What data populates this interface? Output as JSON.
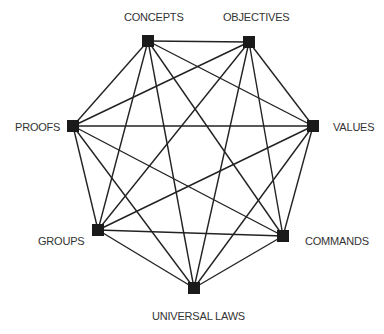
{
  "diagram": {
    "type": "complete-graph",
    "node_color": "#1a1a1a",
    "edge_color": "#222222",
    "nodes": [
      {
        "id": "concepts",
        "label": "CONCEPTS",
        "x": 148,
        "y": 41,
        "label_x": 124,
        "label_y": 11
      },
      {
        "id": "objectives",
        "label": "OBJECTIVES",
        "x": 249,
        "y": 42,
        "label_x": 223,
        "label_y": 11
      },
      {
        "id": "values",
        "label": "VALUES",
        "x": 313,
        "y": 126,
        "label_x": 333,
        "label_y": 121
      },
      {
        "id": "commands",
        "label": "COMMANDS",
        "x": 283,
        "y": 236,
        "label_x": 305,
        "label_y": 235
      },
      {
        "id": "universal-laws",
        "label": "UNIVERSAL LAWS",
        "x": 194,
        "y": 288,
        "label_x": 152,
        "label_y": 310
      },
      {
        "id": "groups",
        "label": "GROUPS",
        "x": 98,
        "y": 230,
        "label_x": 38,
        "label_y": 235
      },
      {
        "id": "proofs",
        "label": "PROOFS",
        "x": 73,
        "y": 126,
        "label_x": 15,
        "label_y": 121
      }
    ],
    "edges": [
      [
        "concepts",
        "objectives"
      ],
      [
        "concepts",
        "values"
      ],
      [
        "concepts",
        "commands"
      ],
      [
        "concepts",
        "universal-laws"
      ],
      [
        "concepts",
        "groups"
      ],
      [
        "concepts",
        "proofs"
      ],
      [
        "objectives",
        "values"
      ],
      [
        "objectives",
        "commands"
      ],
      [
        "objectives",
        "universal-laws"
      ],
      [
        "objectives",
        "groups"
      ],
      [
        "objectives",
        "proofs"
      ],
      [
        "values",
        "commands"
      ],
      [
        "values",
        "universal-laws"
      ],
      [
        "values",
        "groups"
      ],
      [
        "values",
        "proofs"
      ],
      [
        "commands",
        "universal-laws"
      ],
      [
        "commands",
        "groups"
      ],
      [
        "commands",
        "proofs"
      ],
      [
        "universal-laws",
        "groups"
      ],
      [
        "universal-laws",
        "proofs"
      ],
      [
        "groups",
        "proofs"
      ]
    ]
  }
}
